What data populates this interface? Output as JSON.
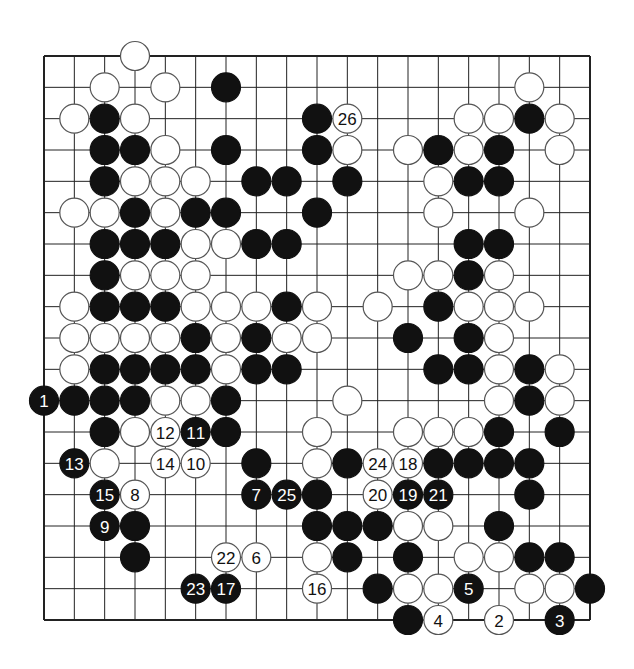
{
  "diagram": {
    "type": "go-board",
    "board_size": 19,
    "colors": {
      "black": "#111111",
      "white": "#ffffff",
      "line": "#222222",
      "background": "#ffffff"
    },
    "stones": [
      {
        "c": 3,
        "r": 0,
        "color": "W"
      },
      {
        "c": 2,
        "r": 1,
        "color": "W"
      },
      {
        "c": 4,
        "r": 1,
        "color": "W"
      },
      {
        "c": 6,
        "r": 1,
        "color": "B"
      },
      {
        "c": 16,
        "r": 1,
        "color": "W"
      },
      {
        "c": 1,
        "r": 2,
        "color": "W"
      },
      {
        "c": 2,
        "r": 2,
        "color": "B"
      },
      {
        "c": 3,
        "r": 2,
        "color": "W"
      },
      {
        "c": 9,
        "r": 2,
        "color": "B"
      },
      {
        "c": 10,
        "r": 2,
        "color": "W",
        "label": "26"
      },
      {
        "c": 14,
        "r": 2,
        "color": "W"
      },
      {
        "c": 15,
        "r": 2,
        "color": "W"
      },
      {
        "c": 16,
        "r": 2,
        "color": "B"
      },
      {
        "c": 17,
        "r": 2,
        "color": "W"
      },
      {
        "c": 2,
        "r": 3,
        "color": "B"
      },
      {
        "c": 3,
        "r": 3,
        "color": "B"
      },
      {
        "c": 4,
        "r": 3,
        "color": "W"
      },
      {
        "c": 6,
        "r": 3,
        "color": "B"
      },
      {
        "c": 9,
        "r": 3,
        "color": "B"
      },
      {
        "c": 10,
        "r": 3,
        "color": "W"
      },
      {
        "c": 12,
        "r": 3,
        "color": "W"
      },
      {
        "c": 13,
        "r": 3,
        "color": "B"
      },
      {
        "c": 14,
        "r": 3,
        "color": "W"
      },
      {
        "c": 15,
        "r": 3,
        "color": "B"
      },
      {
        "c": 17,
        "r": 3,
        "color": "W"
      },
      {
        "c": 2,
        "r": 4,
        "color": "B"
      },
      {
        "c": 3,
        "r": 4,
        "color": "W"
      },
      {
        "c": 4,
        "r": 4,
        "color": "W"
      },
      {
        "c": 5,
        "r": 4,
        "color": "W"
      },
      {
        "c": 7,
        "r": 4,
        "color": "B"
      },
      {
        "c": 8,
        "r": 4,
        "color": "B"
      },
      {
        "c": 10,
        "r": 4,
        "color": "B"
      },
      {
        "c": 13,
        "r": 4,
        "color": "W"
      },
      {
        "c": 14,
        "r": 4,
        "color": "B"
      },
      {
        "c": 15,
        "r": 4,
        "color": "B"
      },
      {
        "c": 1,
        "r": 5,
        "color": "W"
      },
      {
        "c": 2,
        "r": 5,
        "color": "W"
      },
      {
        "c": 3,
        "r": 5,
        "color": "B"
      },
      {
        "c": 4,
        "r": 5,
        "color": "W"
      },
      {
        "c": 5,
        "r": 5,
        "color": "B"
      },
      {
        "c": 6,
        "r": 5,
        "color": "B"
      },
      {
        "c": 9,
        "r": 5,
        "color": "B"
      },
      {
        "c": 13,
        "r": 5,
        "color": "W"
      },
      {
        "c": 16,
        "r": 5,
        "color": "W"
      },
      {
        "c": 2,
        "r": 6,
        "color": "B"
      },
      {
        "c": 3,
        "r": 6,
        "color": "B"
      },
      {
        "c": 4,
        "r": 6,
        "color": "B"
      },
      {
        "c": 5,
        "r": 6,
        "color": "W"
      },
      {
        "c": 6,
        "r": 6,
        "color": "W"
      },
      {
        "c": 7,
        "r": 6,
        "color": "B"
      },
      {
        "c": 8,
        "r": 6,
        "color": "B"
      },
      {
        "c": 14,
        "r": 6,
        "color": "B"
      },
      {
        "c": 15,
        "r": 6,
        "color": "B"
      },
      {
        "c": 2,
        "r": 7,
        "color": "B"
      },
      {
        "c": 3,
        "r": 7,
        "color": "W"
      },
      {
        "c": 4,
        "r": 7,
        "color": "W"
      },
      {
        "c": 5,
        "r": 7,
        "color": "W"
      },
      {
        "c": 12,
        "r": 7,
        "color": "W"
      },
      {
        "c": 13,
        "r": 7,
        "color": "W"
      },
      {
        "c": 14,
        "r": 7,
        "color": "B"
      },
      {
        "c": 15,
        "r": 7,
        "color": "W"
      },
      {
        "c": 1,
        "r": 8,
        "color": "W"
      },
      {
        "c": 2,
        "r": 8,
        "color": "B"
      },
      {
        "c": 3,
        "r": 8,
        "color": "B"
      },
      {
        "c": 4,
        "r": 8,
        "color": "B"
      },
      {
        "c": 5,
        "r": 8,
        "color": "W"
      },
      {
        "c": 6,
        "r": 8,
        "color": "W"
      },
      {
        "c": 7,
        "r": 8,
        "color": "W"
      },
      {
        "c": 8,
        "r": 8,
        "color": "B"
      },
      {
        "c": 9,
        "r": 8,
        "color": "W"
      },
      {
        "c": 11,
        "r": 8,
        "color": "W"
      },
      {
        "c": 13,
        "r": 8,
        "color": "B"
      },
      {
        "c": 14,
        "r": 8,
        "color": "W"
      },
      {
        "c": 15,
        "r": 8,
        "color": "W"
      },
      {
        "c": 16,
        "r": 8,
        "color": "W"
      },
      {
        "c": 1,
        "r": 9,
        "color": "W"
      },
      {
        "c": 2,
        "r": 9,
        "color": "W"
      },
      {
        "c": 3,
        "r": 9,
        "color": "W"
      },
      {
        "c": 4,
        "r": 9,
        "color": "W"
      },
      {
        "c": 5,
        "r": 9,
        "color": "B"
      },
      {
        "c": 6,
        "r": 9,
        "color": "W"
      },
      {
        "c": 7,
        "r": 9,
        "color": "B"
      },
      {
        "c": 8,
        "r": 9,
        "color": "W"
      },
      {
        "c": 9,
        "r": 9,
        "color": "W"
      },
      {
        "c": 12,
        "r": 9,
        "color": "B"
      },
      {
        "c": 14,
        "r": 9,
        "color": "B"
      },
      {
        "c": 15,
        "r": 9,
        "color": "W"
      },
      {
        "c": 1,
        "r": 10,
        "color": "W"
      },
      {
        "c": 2,
        "r": 10,
        "color": "B"
      },
      {
        "c": 3,
        "r": 10,
        "color": "B"
      },
      {
        "c": 4,
        "r": 10,
        "color": "B"
      },
      {
        "c": 5,
        "r": 10,
        "color": "B"
      },
      {
        "c": 6,
        "r": 10,
        "color": "W"
      },
      {
        "c": 7,
        "r": 10,
        "color": "B"
      },
      {
        "c": 8,
        "r": 10,
        "color": "B"
      },
      {
        "c": 13,
        "r": 10,
        "color": "B"
      },
      {
        "c": 14,
        "r": 10,
        "color": "B"
      },
      {
        "c": 15,
        "r": 10,
        "color": "W"
      },
      {
        "c": 16,
        "r": 10,
        "color": "B"
      },
      {
        "c": 17,
        "r": 10,
        "color": "W"
      },
      {
        "c": 0,
        "r": 11,
        "color": "B",
        "label": "1"
      },
      {
        "c": 1,
        "r": 11,
        "color": "B"
      },
      {
        "c": 2,
        "r": 11,
        "color": "B"
      },
      {
        "c": 3,
        "r": 11,
        "color": "B"
      },
      {
        "c": 4,
        "r": 11,
        "color": "W"
      },
      {
        "c": 5,
        "r": 11,
        "color": "W"
      },
      {
        "c": 6,
        "r": 11,
        "color": "B"
      },
      {
        "c": 10,
        "r": 11,
        "color": "W"
      },
      {
        "c": 15,
        "r": 11,
        "color": "W"
      },
      {
        "c": 16,
        "r": 11,
        "color": "B"
      },
      {
        "c": 17,
        "r": 11,
        "color": "W"
      },
      {
        "c": 2,
        "r": 12,
        "color": "B"
      },
      {
        "c": 3,
        "r": 12,
        "color": "W"
      },
      {
        "c": 4,
        "r": 12,
        "color": "W",
        "label": "12"
      },
      {
        "c": 5,
        "r": 12,
        "color": "B",
        "label": "11"
      },
      {
        "c": 6,
        "r": 12,
        "color": "B"
      },
      {
        "c": 9,
        "r": 12,
        "color": "W"
      },
      {
        "c": 12,
        "r": 12,
        "color": "W"
      },
      {
        "c": 13,
        "r": 12,
        "color": "W"
      },
      {
        "c": 14,
        "r": 12,
        "color": "W"
      },
      {
        "c": 15,
        "r": 12,
        "color": "B"
      },
      {
        "c": 17,
        "r": 12,
        "color": "B"
      },
      {
        "c": 1,
        "r": 13,
        "color": "B",
        "label": "13"
      },
      {
        "c": 2,
        "r": 13,
        "color": "W"
      },
      {
        "c": 4,
        "r": 13,
        "color": "W",
        "label": "14"
      },
      {
        "c": 5,
        "r": 13,
        "color": "W",
        "label": "10"
      },
      {
        "c": 7,
        "r": 13,
        "color": "B"
      },
      {
        "c": 9,
        "r": 13,
        "color": "W"
      },
      {
        "c": 10,
        "r": 13,
        "color": "B"
      },
      {
        "c": 11,
        "r": 13,
        "color": "W",
        "label": "24"
      },
      {
        "c": 12,
        "r": 13,
        "color": "W",
        "label": "18"
      },
      {
        "c": 13,
        "r": 13,
        "color": "B"
      },
      {
        "c": 14,
        "r": 13,
        "color": "B"
      },
      {
        "c": 15,
        "r": 13,
        "color": "B"
      },
      {
        "c": 16,
        "r": 13,
        "color": "B"
      },
      {
        "c": 2,
        "r": 14,
        "color": "B",
        "label": "15"
      },
      {
        "c": 3,
        "r": 14,
        "color": "W",
        "label": "8"
      },
      {
        "c": 7,
        "r": 14,
        "color": "B",
        "label": "7"
      },
      {
        "c": 8,
        "r": 14,
        "color": "B",
        "label": "25"
      },
      {
        "c": 9,
        "r": 14,
        "color": "B"
      },
      {
        "c": 11,
        "r": 14,
        "color": "W",
        "label": "20"
      },
      {
        "c": 12,
        "r": 14,
        "color": "B",
        "label": "19"
      },
      {
        "c": 13,
        "r": 14,
        "color": "B",
        "label": "21"
      },
      {
        "c": 16,
        "r": 14,
        "color": "B"
      },
      {
        "c": 2,
        "r": 15,
        "color": "B",
        "label": "9"
      },
      {
        "c": 3,
        "r": 15,
        "color": "B"
      },
      {
        "c": 9,
        "r": 15,
        "color": "B"
      },
      {
        "c": 10,
        "r": 15,
        "color": "B"
      },
      {
        "c": 11,
        "r": 15,
        "color": "B"
      },
      {
        "c": 12,
        "r": 15,
        "color": "W"
      },
      {
        "c": 13,
        "r": 15,
        "color": "W"
      },
      {
        "c": 15,
        "r": 15,
        "color": "B"
      },
      {
        "c": 3,
        "r": 16,
        "color": "B"
      },
      {
        "c": 6,
        "r": 16,
        "color": "W",
        "label": "22"
      },
      {
        "c": 7,
        "r": 16,
        "color": "W",
        "label": "6"
      },
      {
        "c": 9,
        "r": 16,
        "color": "W"
      },
      {
        "c": 10,
        "r": 16,
        "color": "B"
      },
      {
        "c": 12,
        "r": 16,
        "color": "B"
      },
      {
        "c": 14,
        "r": 16,
        "color": "W"
      },
      {
        "c": 15,
        "r": 16,
        "color": "W"
      },
      {
        "c": 16,
        "r": 16,
        "color": "B"
      },
      {
        "c": 17,
        "r": 16,
        "color": "B"
      },
      {
        "c": 5,
        "r": 17,
        "color": "B",
        "label": "23"
      },
      {
        "c": 6,
        "r": 17,
        "color": "B",
        "label": "17"
      },
      {
        "c": 9,
        "r": 17,
        "color": "W",
        "label": "16"
      },
      {
        "c": 11,
        "r": 17,
        "color": "B"
      },
      {
        "c": 12,
        "r": 17,
        "color": "W"
      },
      {
        "c": 13,
        "r": 17,
        "color": "W"
      },
      {
        "c": 14,
        "r": 17,
        "color": "B",
        "label": "5"
      },
      {
        "c": 16,
        "r": 17,
        "color": "W"
      },
      {
        "c": 17,
        "r": 17,
        "color": "W"
      },
      {
        "c": 18,
        "r": 17,
        "color": "B"
      },
      {
        "c": 12,
        "r": 18,
        "color": "B"
      },
      {
        "c": 13,
        "r": 18,
        "color": "W",
        "label": "4"
      },
      {
        "c": 15,
        "r": 18,
        "color": "W",
        "label": "2"
      },
      {
        "c": 17,
        "r": 18,
        "color": "B",
        "label": "3"
      }
    ]
  }
}
